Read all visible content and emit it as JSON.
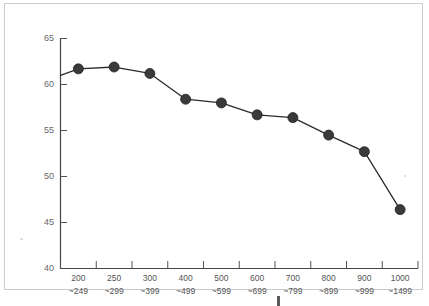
{
  "chart_data": {
    "type": "line",
    "title": "",
    "subtitle": "",
    "xlabel": "",
    "ylabel": "",
    "categories": [
      "200\n~249",
      "250\n~299",
      "300\n~399",
      "400\n~499",
      "500\n~599",
      "600\n~699",
      "700\n~799",
      "800\n~899",
      "900\n~999",
      "1000\n~1499"
    ],
    "category_upper": [
      "200",
      "250",
      "300",
      "400",
      "500",
      "600",
      "700",
      "800",
      "900",
      "1000"
    ],
    "category_lower": [
      "~249",
      "~299",
      "~399",
      "~499",
      "~599",
      "~699",
      "~799",
      "~899",
      "~999",
      "~1499"
    ],
    "values": [
      61.7,
      61.9,
      61.2,
      58.4,
      58.0,
      56.7,
      56.4,
      54.5,
      52.7,
      46.4
    ],
    "series": [
      {
        "name": "series-1",
        "values": [
          61.7,
          61.9,
          61.2,
          58.4,
          58.0,
          56.7,
          56.4,
          54.5,
          52.7,
          46.4
        ]
      }
    ],
    "axis_entry_value": 61.0,
    "ylim": [
      40,
      65
    ],
    "yticks": [
      40,
      45,
      50,
      55,
      60,
      65
    ],
    "ytick_labels": [
      "40",
      "45",
      "50",
      "55",
      "60",
      "65"
    ],
    "grid": false,
    "legend": false,
    "legend_position": "none",
    "marker": "circle",
    "marker_color": "#3a3a3a",
    "line_color": "#2b2b2b",
    "axis_color": "#444444",
    "tick_label_color": "#666666",
    "frame_color": "#cccccc",
    "background_color": "#ffffff"
  }
}
